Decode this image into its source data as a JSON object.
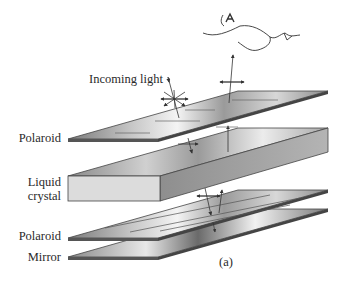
{
  "figure": {
    "caption": "(a)",
    "annotation": "Incoming light",
    "layers": [
      {
        "id": "top-polaroid",
        "label": "Polaroid"
      },
      {
        "id": "liquid-crystal",
        "label_line1": "Liquid",
        "label_line2": "crystal"
      },
      {
        "id": "bottom-polaroid",
        "label": "Polaroid"
      },
      {
        "id": "mirror",
        "label": "Mirror"
      }
    ],
    "observer": "eye-viewer-sketch"
  },
  "colors": {
    "plate_dark": "#6e6e6e",
    "plate_light": "#f2f2f2",
    "edge": "#3a3a3a",
    "text": "#2a2a2a"
  }
}
